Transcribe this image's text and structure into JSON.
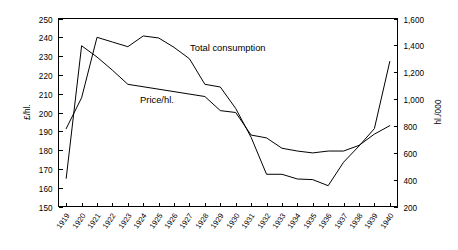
{
  "chart_data": {
    "type": "line",
    "title": "",
    "xlabel": "",
    "x": [
      "1919",
      "1920",
      "1921",
      "1922",
      "1923",
      "1924",
      "1925",
      "1926",
      "1927",
      "1928",
      "1929",
      "1930",
      "1931",
      "1932",
      "1933",
      "1934",
      "1935",
      "1936",
      "1937",
      "1938",
      "1939",
      "1940"
    ],
    "grid": false,
    "legend_position": "inline-annotation",
    "axes": {
      "left": {
        "label": "£/hl.",
        "ylim": [
          150,
          250
        ],
        "ticks": [
          150,
          160,
          170,
          180,
          190,
          200,
          210,
          220,
          230,
          240,
          250
        ],
        "tick_labels": [
          "150",
          "160",
          "170",
          "180",
          "190",
          "200",
          "210",
          "220",
          "230",
          "240",
          "250"
        ]
      },
      "right": {
        "label": "hl./000",
        "ylim": [
          200,
          1600
        ],
        "ticks": [
          200,
          400,
          600,
          800,
          1000,
          1200,
          1400,
          1600
        ],
        "tick_labels": [
          "200",
          "400",
          "600",
          "800",
          "1,000",
          "1,200",
          "1,400",
          "1,600"
        ]
      }
    },
    "series": [
      {
        "name": "Price/hl.",
        "axis": "left",
        "unit": "£/hl.",
        "label_text": "Price/hl.",
        "x": [
          "1919",
          "1920",
          "1921",
          "1922",
          "1923",
          "1928",
          "1929",
          "1930",
          "1931",
          "1932",
          "1933",
          "1934",
          "1935",
          "1936",
          "1937",
          "1938",
          "1939",
          "1940"
        ],
        "values": [
          165,
          235.5,
          229.5,
          222.5,
          215,
          208.5,
          201,
          200,
          188,
          186.5,
          181,
          179.5,
          178.5,
          179.5,
          179.5,
          182.5,
          188.5,
          193
        ]
      },
      {
        "name": "Total consumption",
        "axis": "right",
        "unit": "hl./000",
        "label_text": "Total consumption",
        "x": [
          "1919",
          "1920",
          "1921",
          "1922",
          "1923",
          "1924",
          "1925",
          "1926",
          "1927",
          "1928",
          "1929",
          "1930",
          "1931",
          "1932",
          "1933",
          "1934",
          "1935",
          "1936",
          "1937",
          "1938",
          "1939",
          "1940"
        ],
        "values": [
          780,
          1010,
          1460,
          1425,
          1390,
          1470,
          1455,
          1385,
          1300,
          1110,
          1090,
          930,
          715,
          440,
          440,
          405,
          400,
          355,
          530,
          650,
          780,
          1280
        ]
      }
    ],
    "annotations": [
      {
        "text": "Total consumption",
        "x_px": 190,
        "y_px": 51
      },
      {
        "text": "Price/hl.",
        "x_px": 140,
        "y_px": 103
      }
    ]
  }
}
